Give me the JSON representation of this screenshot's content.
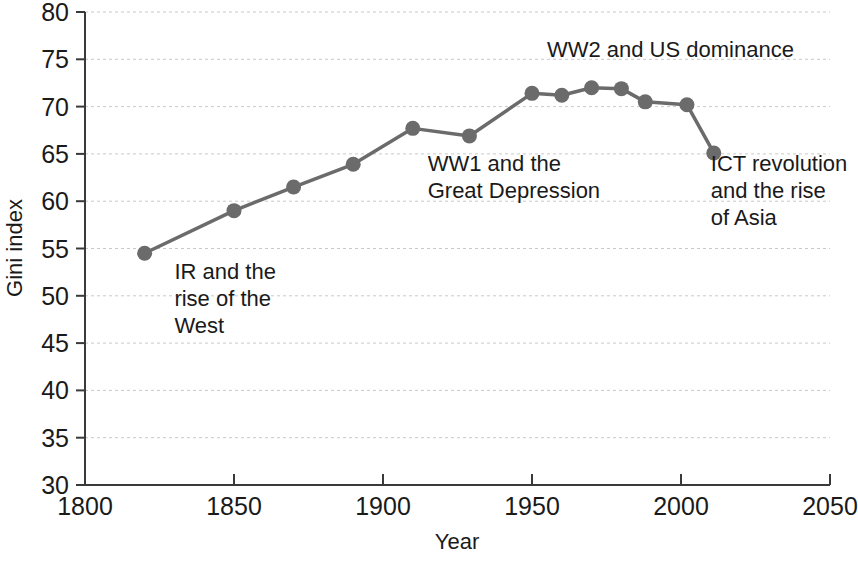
{
  "chart_data": {
    "type": "line",
    "title": "",
    "xlabel": "Year",
    "ylabel": "Gini index",
    "xlim": [
      1800,
      2050
    ],
    "ylim": [
      30,
      80
    ],
    "xticks": [
      1800,
      1850,
      1900,
      1950,
      2000,
      2050
    ],
    "yticks": [
      30,
      35,
      40,
      45,
      50,
      55,
      60,
      65,
      70,
      75,
      80
    ],
    "grid": true,
    "grid_axis": "y",
    "legend": false,
    "marker": "circle",
    "line_color": "#6b6b6b",
    "marker_color": "#6b6b6b",
    "x": [
      1820,
      1850,
      1870,
      1890,
      1910,
      1929,
      1950,
      1960,
      1970,
      1980,
      1988,
      2002,
      2011
    ],
    "values": [
      54.5,
      59.0,
      61.5,
      63.9,
      67.7,
      66.9,
      71.4,
      71.2,
      72.0,
      71.9,
      70.5,
      70.2,
      65.1
    ],
    "annotations": [
      {
        "id": "ir-west",
        "lines": [
          "IR and the",
          "rise of the",
          "West"
        ],
        "x": 1830,
        "y": 51.8
      },
      {
        "id": "ww1-depression",
        "lines": [
          "WW1 and the",
          "Great Depression"
        ],
        "x": 1915,
        "y": 63.2
      },
      {
        "id": "ww2-us-dominance",
        "lines": [
          "WW2 and US dominance"
        ],
        "x": 1955,
        "y": 75.2
      },
      {
        "id": "ict-asia",
        "lines": [
          "ICT revolution",
          "and the rise",
          "of Asia"
        ],
        "x": 2010,
        "y": 63.2
      }
    ]
  },
  "axis": {
    "x_tick_labels": [
      "1800",
      "1850",
      "1900",
      "1950",
      "2000",
      "2050"
    ],
    "y_tick_labels": [
      "30",
      "35",
      "40",
      "45",
      "50",
      "55",
      "60",
      "65",
      "70",
      "75",
      "80"
    ],
    "x_title": "Year",
    "y_title": "Gini index"
  },
  "annotations_flat": {
    "a0l0": "IR and the",
    "a0l1": "rise of the",
    "a0l2": "West",
    "a1l0": "WW1 and the",
    "a1l1": "Great Depression",
    "a2l0": "WW2 and US dominance",
    "a3l0": "ICT revolution",
    "a3l1": "and the rise",
    "a3l2": "of Asia"
  },
  "colors": {
    "line": "#6b6b6b",
    "axis": "#3a3a3a",
    "grid": "#c9c9c9",
    "text": "#1a1a1a"
  }
}
